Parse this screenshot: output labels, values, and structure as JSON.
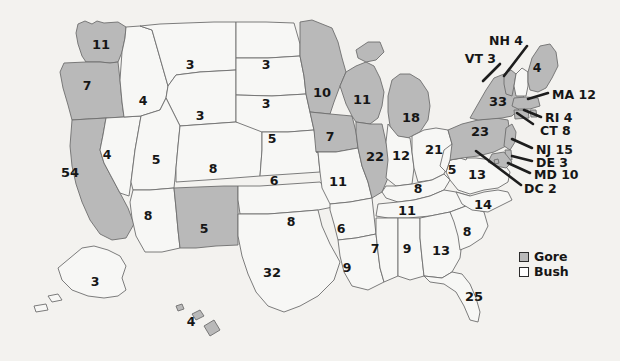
{
  "map": {
    "title": "2000 United States presidential election electoral vote map",
    "colors": {
      "gore_fill": "#b9b9b9",
      "bush_fill": "#f7f7f5",
      "border": "#6e6e6e",
      "background": "#f3f2ef",
      "text": "#161616"
    }
  },
  "legend": {
    "items": [
      {
        "label": "Gore",
        "swatch": "gore",
        "name": "legend-gore"
      },
      {
        "label": "Bush",
        "swatch": "bush",
        "name": "legend-bush"
      }
    ]
  },
  "chart_data": {
    "type": "map",
    "unit": "electoral votes",
    "legend": [
      "Gore",
      "Bush"
    ],
    "legend_position": "bottom-right",
    "series": [
      {
        "name": "Gore",
        "fill": "#b9b9b9"
      },
      {
        "name": "Bush",
        "fill": "#f7f7f5"
      }
    ],
    "states": [
      {
        "code": "WA",
        "value": 11,
        "winner": "Gore",
        "labeled": "inside"
      },
      {
        "code": "OR",
        "value": 7,
        "winner": "Gore",
        "labeled": "inside"
      },
      {
        "code": "CA",
        "value": 54,
        "winner": "Gore",
        "labeled": "inside"
      },
      {
        "code": "NV",
        "value": 4,
        "winner": "Bush",
        "labeled": "inside"
      },
      {
        "code": "ID",
        "value": 4,
        "winner": "Bush",
        "labeled": "inside"
      },
      {
        "code": "MT",
        "value": 3,
        "winner": "Bush",
        "labeled": "inside"
      },
      {
        "code": "WY",
        "value": 3,
        "winner": "Bush",
        "labeled": "inside"
      },
      {
        "code": "UT",
        "value": 5,
        "winner": "Bush",
        "labeled": "inside"
      },
      {
        "code": "AZ",
        "value": 8,
        "winner": "Bush",
        "labeled": "inside"
      },
      {
        "code": "NM",
        "value": 5,
        "winner": "Gore",
        "labeled": "inside"
      },
      {
        "code": "CO",
        "value": 8,
        "winner": "Bush",
        "labeled": "inside"
      },
      {
        "code": "ND",
        "value": 3,
        "winner": "Bush",
        "labeled": "inside"
      },
      {
        "code": "SD",
        "value": 3,
        "winner": "Bush",
        "labeled": "inside"
      },
      {
        "code": "NE",
        "value": 5,
        "winner": "Bush",
        "labeled": "inside"
      },
      {
        "code": "KS",
        "value": 6,
        "winner": "Bush",
        "labeled": "inside"
      },
      {
        "code": "OK",
        "value": 8,
        "winner": "Bush",
        "labeled": "inside"
      },
      {
        "code": "TX",
        "value": 32,
        "winner": "Bush",
        "labeled": "inside"
      },
      {
        "code": "MN",
        "value": 10,
        "winner": "Gore",
        "labeled": "inside"
      },
      {
        "code": "IA",
        "value": 7,
        "winner": "Gore",
        "labeled": "inside"
      },
      {
        "code": "MO",
        "value": 11,
        "winner": "Bush",
        "labeled": "inside"
      },
      {
        "code": "AR",
        "value": 6,
        "winner": "Bush",
        "labeled": "inside"
      },
      {
        "code": "LA",
        "value": 9,
        "winner": "Bush",
        "labeled": "inside"
      },
      {
        "code": "WI",
        "value": 11,
        "winner": "Gore",
        "labeled": "inside"
      },
      {
        "code": "IL",
        "value": 22,
        "winner": "Gore",
        "labeled": "inside"
      },
      {
        "code": "MI",
        "value": 18,
        "winner": "Gore",
        "labeled": "inside"
      },
      {
        "code": "IN",
        "value": 12,
        "winner": "Bush",
        "labeled": "inside"
      },
      {
        "code": "OH",
        "value": 21,
        "winner": "Bush",
        "labeled": "inside"
      },
      {
        "code": "KY",
        "value": 8,
        "winner": "Bush",
        "labeled": "inside"
      },
      {
        "code": "TN",
        "value": 11,
        "winner": "Bush",
        "labeled": "inside"
      },
      {
        "code": "MS",
        "value": 7,
        "winner": "Bush",
        "labeled": "inside"
      },
      {
        "code": "AL",
        "value": 9,
        "winner": "Bush",
        "labeled": "inside"
      },
      {
        "code": "GA",
        "value": 13,
        "winner": "Bush",
        "labeled": "inside"
      },
      {
        "code": "SC",
        "value": 8,
        "winner": "Bush",
        "labeled": "inside"
      },
      {
        "code": "NC",
        "value": 14,
        "winner": "Bush",
        "labeled": "inside"
      },
      {
        "code": "VA",
        "value": 13,
        "winner": "Bush",
        "labeled": "inside"
      },
      {
        "code": "WV",
        "value": 5,
        "winner": "Bush",
        "labeled": "inside"
      },
      {
        "code": "FL",
        "value": 25,
        "winner": "Bush",
        "labeled": "inside"
      },
      {
        "code": "PA",
        "value": 23,
        "winner": "Gore",
        "labeled": "inside"
      },
      {
        "code": "NY",
        "value": 33,
        "winner": "Gore",
        "labeled": "inside"
      },
      {
        "code": "ME",
        "value": 4,
        "winner": "Gore",
        "labeled": "inside"
      },
      {
        "code": "AK",
        "value": 3,
        "winner": "Bush",
        "labeled": "inside"
      },
      {
        "code": "HI",
        "value": 4,
        "winner": "Gore",
        "labeled": "inside"
      },
      {
        "code": "VT",
        "value": 3,
        "winner": "Gore",
        "labeled": "callout"
      },
      {
        "code": "NH",
        "value": 4,
        "winner": "Bush",
        "labeled": "callout"
      },
      {
        "code": "MA",
        "value": 12,
        "winner": "Gore",
        "labeled": "callout"
      },
      {
        "code": "RI",
        "value": 4,
        "winner": "Gore",
        "labeled": "callout"
      },
      {
        "code": "CT",
        "value": 8,
        "winner": "Gore",
        "labeled": "callout"
      },
      {
        "code": "NJ",
        "value": 15,
        "winner": "Gore",
        "labeled": "callout"
      },
      {
        "code": "DE",
        "value": 3,
        "winner": "Gore",
        "labeled": "callout"
      },
      {
        "code": "MD",
        "value": 10,
        "winner": "Gore",
        "labeled": "callout"
      },
      {
        "code": "DC",
        "value": 2,
        "winner": "Gore",
        "labeled": "callout"
      }
    ]
  },
  "inside_labels": [
    {
      "code": "WA",
      "text": "11",
      "x": 101,
      "y": 44
    },
    {
      "code": "OR",
      "text": "7",
      "x": 87,
      "y": 86
    },
    {
      "code": "CA",
      "text": "54",
      "x": 70,
      "y": 172
    },
    {
      "code": "NV",
      "text": "4",
      "x": 107,
      "y": 155
    },
    {
      "code": "ID",
      "text": "4",
      "x": 143,
      "y": 101
    },
    {
      "code": "MT",
      "text": "3",
      "x": 190,
      "y": 65
    },
    {
      "code": "WY",
      "text": "3",
      "x": 200,
      "y": 116
    },
    {
      "code": "UT",
      "text": "5",
      "x": 156,
      "y": 160
    },
    {
      "code": "AZ",
      "text": "8",
      "x": 148,
      "y": 216
    },
    {
      "code": "NM",
      "text": "5",
      "x": 204,
      "y": 229
    },
    {
      "code": "CO",
      "text": "8",
      "x": 213,
      "y": 169
    },
    {
      "code": "ND",
      "text": "3",
      "x": 266,
      "y": 65
    },
    {
      "code": "SD",
      "text": "3",
      "x": 266,
      "y": 104
    },
    {
      "code": "SD2",
      "text": "5",
      "x": 272,
      "y": 139
    },
    {
      "code": "KS",
      "text": "6",
      "x": 274,
      "y": 181
    },
    {
      "code": "OK",
      "text": "8",
      "x": 291,
      "y": 222
    },
    {
      "code": "TX",
      "text": "32",
      "x": 272,
      "y": 272
    },
    {
      "code": "MN",
      "text": "10",
      "x": 322,
      "y": 92
    },
    {
      "code": "IA",
      "text": "7",
      "x": 330,
      "y": 137
    },
    {
      "code": "MO",
      "text": "11",
      "x": 338,
      "y": 181
    },
    {
      "code": "AR",
      "text": "6",
      "x": 341,
      "y": 229
    },
    {
      "code": "LA",
      "text": "9",
      "x": 347,
      "y": 268
    },
    {
      "code": "WI",
      "text": "11",
      "x": 362,
      "y": 99
    },
    {
      "code": "IL",
      "text": "22",
      "x": 375,
      "y": 156
    },
    {
      "code": "MI",
      "text": "18",
      "x": 411,
      "y": 117
    },
    {
      "code": "IN",
      "text": "12",
      "x": 401,
      "y": 155
    },
    {
      "code": "OH",
      "text": "21",
      "x": 434,
      "y": 149
    },
    {
      "code": "KY",
      "text": "8",
      "x": 418,
      "y": 189
    },
    {
      "code": "TN",
      "text": "11",
      "x": 407,
      "y": 210
    },
    {
      "code": "MS",
      "text": "7",
      "x": 375,
      "y": 249
    },
    {
      "code": "AL",
      "text": "9",
      "x": 407,
      "y": 249
    },
    {
      "code": "GA",
      "text": "13",
      "x": 441,
      "y": 250
    },
    {
      "code": "SC",
      "text": "8",
      "x": 467,
      "y": 232
    },
    {
      "code": "NC",
      "text": "14",
      "x": 483,
      "y": 204
    },
    {
      "code": "VA",
      "text": "13",
      "x": 477,
      "y": 174
    },
    {
      "code": "WV",
      "text": "5",
      "x": 452,
      "y": 170
    },
    {
      "code": "FL",
      "text": "25",
      "x": 474,
      "y": 296
    },
    {
      "code": "PA",
      "text": "23",
      "x": 480,
      "y": 131
    },
    {
      "code": "NY",
      "text": "33",
      "x": 498,
      "y": 101
    },
    {
      "code": "ME",
      "text": "4",
      "x": 537,
      "y": 68
    },
    {
      "code": "AK",
      "text": "3",
      "x": 95,
      "y": 282
    },
    {
      "code": "HI",
      "text": "4",
      "x": 191,
      "y": 322
    }
  ],
  "callout_labels": [
    {
      "code": "NH",
      "text": "NH 4",
      "x": 523,
      "y": 41,
      "align": "r"
    },
    {
      "code": "VT",
      "text": "VT 3",
      "x": 496,
      "y": 59,
      "align": "r"
    },
    {
      "code": "MA",
      "text": "MA 12",
      "x": 552,
      "y": 95,
      "align": "l"
    },
    {
      "code": "RI",
      "text": "RI 4",
      "x": 545,
      "y": 118,
      "align": "l"
    },
    {
      "code": "CT",
      "text": "CT 8",
      "x": 540,
      "y": 131,
      "align": "l"
    },
    {
      "code": "NJ",
      "text": "NJ 15",
      "x": 536,
      "y": 150,
      "align": "l"
    },
    {
      "code": "DE",
      "text": "DE 3",
      "x": 536,
      "y": 163,
      "align": "l"
    },
    {
      "code": "MD",
      "text": "MD 10",
      "x": 534,
      "y": 175,
      "align": "l"
    },
    {
      "code": "DC",
      "text": "DC 2",
      "x": 524,
      "y": 189,
      "align": "l"
    }
  ],
  "leader_lines": [
    {
      "code": "NH",
      "x1": 527,
      "y1": 46,
      "x2": 504,
      "y2": 76
    },
    {
      "code": "VT",
      "x1": 500,
      "y1": 64,
      "x2": 483,
      "y2": 81
    },
    {
      "code": "MA",
      "x1": 548,
      "y1": 93,
      "x2": 528,
      "y2": 99
    },
    {
      "code": "RI",
      "x1": 541,
      "y1": 117,
      "x2": 524,
      "y2": 110
    },
    {
      "code": "CT",
      "x1": 533,
      "y1": 124,
      "x2": 517,
      "y2": 113
    },
    {
      "code": "NJ",
      "x1": 532,
      "y1": 148,
      "x2": 512,
      "y2": 139
    },
    {
      "code": "DE",
      "x1": 532,
      "y1": 161,
      "x2": 512,
      "y2": 156
    },
    {
      "code": "MD",
      "x1": 530,
      "y1": 173,
      "x2": 508,
      "y2": 163
    },
    {
      "code": "DC",
      "x1": 521,
      "y1": 185,
      "x2": 476,
      "y2": 151
    }
  ]
}
